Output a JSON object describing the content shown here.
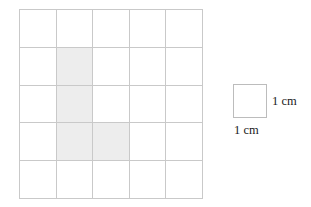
{
  "figure": {
    "type": "grid-diagram",
    "title": "",
    "grid": {
      "rows": 5,
      "columns": 5,
      "cell_size_cm": 1,
      "line_color": "#c9c9c9",
      "cell_fill": "#ffffff",
      "shaded_fill": "#ededed",
      "shaded_cells": [
        {
          "row": 2,
          "col": 2
        },
        {
          "row": 3,
          "col": 2
        },
        {
          "row": 4,
          "col": 2
        },
        {
          "row": 4,
          "col": 3
        }
      ],
      "shaded_count": 4,
      "cells": [
        [
          false,
          false,
          false,
          false,
          false
        ],
        [
          false,
          true,
          false,
          false,
          false
        ],
        [
          false,
          true,
          false,
          false,
          false
        ],
        [
          false,
          true,
          true,
          false,
          false
        ],
        [
          false,
          false,
          false,
          false,
          false
        ]
      ]
    },
    "legend": {
      "square_label": "unit-square",
      "width_label": "1 cm",
      "height_label": "1 cm",
      "border_color": "#bcbcbc"
    }
  }
}
